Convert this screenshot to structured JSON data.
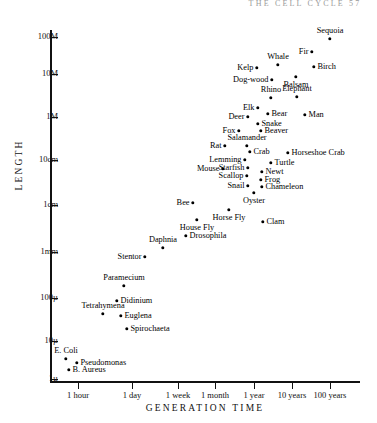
{
  "page": {
    "header": "THE CELL CYCLE   57"
  },
  "chart_data": {
    "type": "scatter",
    "title": "",
    "xlabel": "GENERATION TIME",
    "ylabel": "LENGTH",
    "x_scale": "log",
    "y_scale": "log",
    "grid": false,
    "legend": null,
    "y_ticks": [
      {
        "label": "100M",
        "px": 37
      },
      {
        "label": "10M",
        "px": 74
      },
      {
        "label": "1M",
        "px": 117
      },
      {
        "label": "10cm",
        "px": 160
      },
      {
        "label": "1cm",
        "px": 205
      },
      {
        "label": "1mm",
        "px": 252
      },
      {
        "label": "100µ",
        "px": 298
      },
      {
        "label": "10µ",
        "px": 341
      },
      {
        "label": "1µ",
        "px": 379
      }
    ],
    "x_ticks": [
      {
        "label": "1 hour",
        "px": 78
      },
      {
        "label": "1 day",
        "px": 132
      },
      {
        "label": "1 week",
        "px": 178
      },
      {
        "label": "1 month",
        "px": 215
      },
      {
        "label": "1 year",
        "px": 254
      },
      {
        "label": "10 years",
        "px": 292
      },
      {
        "label": "100 years",
        "px": 330
      }
    ],
    "points": [
      {
        "name": "Sequoia",
        "x": 330,
        "y": 39,
        "pos": "t"
      },
      {
        "name": "Fir",
        "x": 312,
        "y": 52,
        "pos": "l"
      },
      {
        "name": "Whale",
        "x": 278,
        "y": 65,
        "pos": "t"
      },
      {
        "name": "Birch",
        "x": 314,
        "y": 67,
        "pos": "r"
      },
      {
        "name": "Kelp",
        "x": 257,
        "y": 68,
        "pos": "l"
      },
      {
        "name": "Balsam",
        "x": 296,
        "y": 77,
        "pos": "b"
      },
      {
        "name": "Dog-wood",
        "x": 272,
        "y": 80,
        "pos": "l"
      },
      {
        "name": "Elephant",
        "x": 297,
        "y": 97,
        "pos": "t"
      },
      {
        "name": "Rhino",
        "x": 271,
        "y": 98,
        "pos": "t"
      },
      {
        "name": "Elk",
        "x": 258,
        "y": 108,
        "pos": "l"
      },
      {
        "name": "Bear",
        "x": 268,
        "y": 114,
        "pos": "r"
      },
      {
        "name": "Man",
        "x": 305,
        "y": 115,
        "pos": "r"
      },
      {
        "name": "Deer",
        "x": 248,
        "y": 117,
        "pos": "l"
      },
      {
        "name": "Snake",
        "x": 258,
        "y": 124,
        "pos": "r"
      },
      {
        "name": "Fox",
        "x": 239,
        "y": 131,
        "pos": "l"
      },
      {
        "name": "Beaver",
        "x": 261,
        "y": 131,
        "pos": "r"
      },
      {
        "name": "Rat",
        "x": 225,
        "y": 146,
        "pos": "l"
      },
      {
        "name": "Salamander",
        "x": 247,
        "y": 146,
        "pos": "t"
      },
      {
        "name": "Crab",
        "x": 250,
        "y": 152,
        "pos": "r"
      },
      {
        "name": "Horseshoe Crab",
        "x": 288,
        "y": 153,
        "pos": "r"
      },
      {
        "name": "Lemming",
        "x": 245,
        "y": 160,
        "pos": "l"
      },
      {
        "name": "Turtle",
        "x": 271,
        "y": 163,
        "pos": "r"
      },
      {
        "name": "Starfish",
        "x": 248,
        "y": 168,
        "pos": "l"
      },
      {
        "name": "Mouse",
        "x": 223,
        "y": 169,
        "pos": "l"
      },
      {
        "name": "Newt",
        "x": 262,
        "y": 172,
        "pos": "r"
      },
      {
        "name": "Scallop",
        "x": 247,
        "y": 176,
        "pos": "l"
      },
      {
        "name": "Frog",
        "x": 261,
        "y": 180,
        "pos": "r"
      },
      {
        "name": "Snail",
        "x": 248,
        "y": 186,
        "pos": "l"
      },
      {
        "name": "Chameleon",
        "x": 262,
        "y": 187,
        "pos": "r"
      },
      {
        "name": "Oyster",
        "x": 254,
        "y": 193,
        "pos": "b"
      },
      {
        "name": "Bee",
        "x": 193,
        "y": 203,
        "pos": "l"
      },
      {
        "name": "Horse Fly",
        "x": 229,
        "y": 210,
        "pos": "b"
      },
      {
        "name": "House Fly",
        "x": 197,
        "y": 220,
        "pos": "b"
      },
      {
        "name": "Clam",
        "x": 263,
        "y": 222,
        "pos": "r"
      },
      {
        "name": "Drosophila",
        "x": 186,
        "y": 236,
        "pos": "r"
      },
      {
        "name": "Daphnia",
        "x": 163,
        "y": 248,
        "pos": "t"
      },
      {
        "name": "Stentor",
        "x": 145,
        "y": 257,
        "pos": "l"
      },
      {
        "name": "Paramecium",
        "x": 124,
        "y": 286,
        "pos": "t"
      },
      {
        "name": "Didinium",
        "x": 117,
        "y": 301,
        "pos": "r"
      },
      {
        "name": "Tetrahymena",
        "x": 103,
        "y": 314,
        "pos": "t"
      },
      {
        "name": "Euglena",
        "x": 121,
        "y": 316,
        "pos": "r"
      },
      {
        "name": "Spirochaeta",
        "x": 127,
        "y": 329,
        "pos": "r"
      },
      {
        "name": "E. Coli",
        "x": 66,
        "y": 359,
        "pos": "t"
      },
      {
        "name": "Pseudomonas",
        "x": 77,
        "y": 363,
        "pos": "r"
      },
      {
        "name": "B. Aureus",
        "x": 69,
        "y": 370,
        "pos": "r"
      }
    ]
  }
}
